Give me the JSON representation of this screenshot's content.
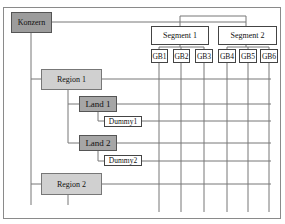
{
  "diagram": {
    "root": {
      "label": "Konzern",
      "color": "#9c9c9c"
    },
    "segments": [
      {
        "label": "Segment 1",
        "units": [
          "GB1",
          "GB2",
          "GB3"
        ]
      },
      {
        "label": "Segment 2",
        "units": [
          "GB4",
          "GB5",
          "GB6"
        ]
      }
    ],
    "regions": [
      {
        "label": "Region 1",
        "color": "#d0d0d0",
        "lands": [
          {
            "label": "Land 1",
            "dummy": "Dummy1"
          },
          {
            "label": "Land 2",
            "dummy": "Dummy2"
          }
        ]
      },
      {
        "label": "Region 2",
        "color": "#d0d0d0",
        "lands": []
      }
    ],
    "land_color": "#a6a6a6"
  }
}
